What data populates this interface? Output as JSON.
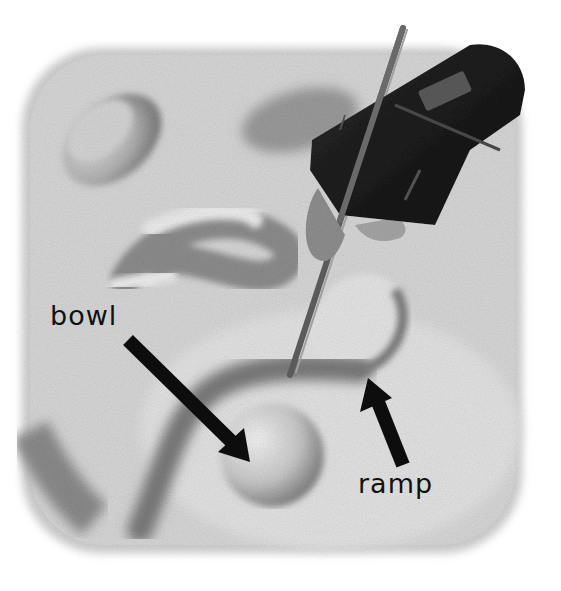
{
  "illustration": {
    "subject": "Hand holding a stick carving shapes into sand",
    "style": "grayscale pencil/charcoal drawing",
    "labels": [
      {
        "text": "bowl",
        "points_to": "round depression in sand"
      },
      {
        "text": "ramp",
        "points_to": "sloped curved channel in sand"
      }
    ],
    "colors": {
      "background": "#ffffff",
      "sand_light": "#e6e6e6",
      "sand_mid": "#bdbdbd",
      "sand_dark": "#8a8a8a",
      "shadow": "#5a5a5a",
      "sleeve": "#1a1a1a",
      "skin": "#9a9a9a",
      "arrow": "#0d0d0d",
      "text": "#111111"
    }
  }
}
